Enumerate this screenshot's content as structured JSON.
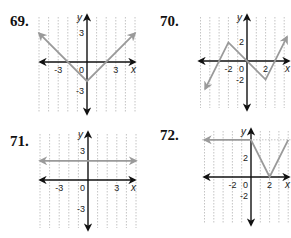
{
  "chart_data": [
    {
      "type": "line",
      "number": "69.",
      "xlabel": "x",
      "ylabel": "y",
      "xlim": [
        -5,
        5
      ],
      "ylim": [
        -4.5,
        4.5
      ],
      "x_ticks": [
        {
          "v": -3,
          "label": "-3"
        },
        {
          "v": 3,
          "label": "3"
        }
      ],
      "y_ticks": [
        {
          "v": 3,
          "label": "3"
        },
        {
          "v": -3,
          "label": "-3"
        }
      ],
      "origin_label": "0",
      "grid": true,
      "series": [
        {
          "name": "f",
          "points": [
            [
              -5,
              3
            ],
            [
              0,
              -2
            ],
            [
              5,
              3
            ]
          ],
          "arrow_start": true,
          "arrow_end": true
        }
      ]
    },
    {
      "type": "line",
      "number": "70.",
      "xlabel": "x",
      "ylabel": "y",
      "xlim": [
        -5,
        4.5
      ],
      "ylim": [
        -5,
        5
      ],
      "x_ticks": [
        {
          "v": -2,
          "label": "-2"
        },
        {
          "v": 2,
          "label": "2"
        }
      ],
      "y_ticks": [
        {
          "v": 2,
          "label": "2"
        },
        {
          "v": -2,
          "label": "-2"
        }
      ],
      "origin_label": "0",
      "grid": true,
      "series": [
        {
          "name": "f",
          "points": [
            [
              -4.5,
              -3
            ],
            [
              -2,
              2
            ],
            [
              2,
              -2
            ],
            [
              4.3,
              2.6
            ]
          ],
          "arrow_start": true,
          "arrow_end": true
        }
      ]
    },
    {
      "type": "line",
      "number": "71.",
      "xlabel": "x",
      "ylabel": "y",
      "xlim": [
        -5,
        5
      ],
      "ylim": [
        -4.5,
        4.5
      ],
      "x_ticks": [
        {
          "v": -3,
          "label": "-3"
        },
        {
          "v": 3,
          "label": "3"
        }
      ],
      "y_ticks": [
        {
          "v": 3,
          "label": "3"
        },
        {
          "v": -3,
          "label": "-3"
        }
      ],
      "origin_label": "0",
      "grid": true,
      "series": [
        {
          "name": "f",
          "points": [
            [
              -5,
              2
            ],
            [
              5,
              2
            ]
          ],
          "arrow_start": true,
          "arrow_end": true
        }
      ]
    },
    {
      "type": "line",
      "number": "72.",
      "xlabel": "x",
      "ylabel": "y",
      "xlim": [
        -5,
        4.5
      ],
      "ylim": [
        -5,
        5
      ],
      "x_ticks": [
        {
          "v": -2,
          "label": "-2"
        },
        {
          "v": 2,
          "label": "2"
        }
      ],
      "y_ticks": [
        {
          "v": 2,
          "label": "2"
        },
        {
          "v": -2,
          "label": "-2"
        }
      ],
      "origin_label": "0",
      "grid": true,
      "series": [
        {
          "name": "f",
          "points": [
            [
              -5,
              4
            ],
            [
              0,
              4
            ],
            [
              2,
              0
            ],
            [
              4,
              4
            ]
          ],
          "arrow_start": true,
          "arrow_end": false
        }
      ]
    }
  ]
}
